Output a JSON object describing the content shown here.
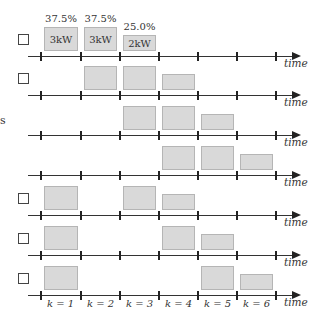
{
  "diagram": {
    "axis_label": "time",
    "slot_labels": [
      "k = 1",
      "k = 2",
      "k = 3",
      "k = 4",
      "k = 5",
      "k = 6"
    ],
    "left_fragments": [
      {
        "row": 3,
        "text": "s"
      }
    ],
    "colors": {
      "box_fill": "#d9d9d9",
      "box_border": "#b5b5b5",
      "axis": "#333333"
    },
    "rows": [
      {
        "index": 1,
        "checkbox": true,
        "blocks": [
          {
            "slot": 1,
            "size": "tall",
            "label": "3kW",
            "percent": "37.5%"
          },
          {
            "slot": 2,
            "size": "tall",
            "label": "3kW",
            "percent": "37.5%"
          },
          {
            "slot": 3,
            "size": "short",
            "label": "2kW",
            "percent": "25.0%"
          }
        ]
      },
      {
        "index": 2,
        "checkbox": true,
        "blocks": [
          {
            "slot": 2,
            "size": "tall"
          },
          {
            "slot": 3,
            "size": "tall"
          },
          {
            "slot": 4,
            "size": "short"
          }
        ]
      },
      {
        "index": 3,
        "checkbox": false,
        "blocks": [
          {
            "slot": 3,
            "size": "tall"
          },
          {
            "slot": 4,
            "size": "tall"
          },
          {
            "slot": 5,
            "size": "short"
          }
        ]
      },
      {
        "index": 4,
        "checkbox": false,
        "blocks": [
          {
            "slot": 4,
            "size": "tall"
          },
          {
            "slot": 5,
            "size": "tall"
          },
          {
            "slot": 6,
            "size": "short"
          }
        ]
      },
      {
        "index": 5,
        "checkbox": true,
        "blocks": [
          {
            "slot": 1,
            "size": "tall"
          },
          {
            "slot": 3,
            "size": "tall"
          },
          {
            "slot": 4,
            "size": "short"
          }
        ]
      },
      {
        "index": 6,
        "checkbox": true,
        "blocks": [
          {
            "slot": 1,
            "size": "tall"
          },
          {
            "slot": 4,
            "size": "tall"
          },
          {
            "slot": 5,
            "size": "short"
          }
        ]
      },
      {
        "index": 7,
        "checkbox": true,
        "blocks": [
          {
            "slot": 1,
            "size": "tall"
          },
          {
            "slot": 5,
            "size": "tall"
          },
          {
            "slot": 6,
            "size": "short"
          }
        ]
      }
    ],
    "row1_labels": {
      "b1_label": "3kW",
      "b1_pct": "37.5%",
      "b2_label": "3kW",
      "b2_pct": "37.5%",
      "b3_label": "2kW",
      "b3_pct": "25.0%"
    }
  }
}
